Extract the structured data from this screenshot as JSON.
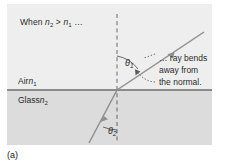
{
  "figure": {
    "part_label": "(a)",
    "condition_text": "When n2 > n1 …",
    "condition_parts": {
      "when": "When ",
      "n_high": "n",
      "n_high_sub": "2",
      "gt": " > ",
      "n_low": "n",
      "n_low_sub": "1",
      "ellipsis": " …"
    },
    "media": {
      "upper": {
        "name": "Air",
        "index_symbol": "n",
        "index_sub": "1",
        "fill": "#eeeeee"
      },
      "lower": {
        "name": "Glass",
        "index_symbol": "n",
        "index_sub": "2",
        "fill": "#dcdcdc"
      }
    },
    "angles": {
      "theta1": {
        "symbol": "θ",
        "sub": "1",
        "measured_from": "normal",
        "side": "air",
        "approx_degrees": 38
      },
      "theta2": {
        "symbol": "θ",
        "sub": "2",
        "measured_from": "normal",
        "side": "glass",
        "approx_degrees": 22
      }
    },
    "callout": {
      "line1": "… ray bends",
      "line2": "away from",
      "line3": "the normal."
    },
    "elements": {
      "normal_line": "dashed-vertical-normal",
      "interface_line": "medium-boundary",
      "incident_ray": "incident-ray-in-glass",
      "refracted_ray": "refracted-ray-in-air"
    },
    "colors": {
      "ink": "#2b2b2b",
      "ray": "#8a8a8a",
      "interface": "#6e6e6e",
      "air_fill": "#eeeeee",
      "glass_fill": "#dcdcdc",
      "page": "#ffffff"
    }
  }
}
